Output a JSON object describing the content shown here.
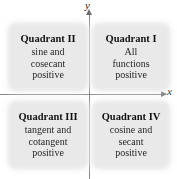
{
  "figure": {
    "axes": {
      "x_label": "x",
      "y_label": "y"
    },
    "colors": {
      "box_fill": "#e9e9e9",
      "axis_line": "#8a8a8a",
      "text": "#111111"
    }
  },
  "quadrants": [
    {
      "id": "quadrant-2",
      "title": "Quadrant II",
      "lines": [
        "sine and",
        "cosecant",
        "positive"
      ]
    },
    {
      "id": "quadrant-1",
      "title": "Quadrant I",
      "lines": [
        "All",
        "functions",
        "positive"
      ]
    },
    {
      "id": "quadrant-3",
      "title": "Quadrant III",
      "lines": [
        "tangent and",
        "cotangent",
        "positive"
      ]
    },
    {
      "id": "quadrant-4",
      "title": "Quadrant IV",
      "lines": [
        "cosine and",
        "secant",
        "positive"
      ]
    }
  ]
}
